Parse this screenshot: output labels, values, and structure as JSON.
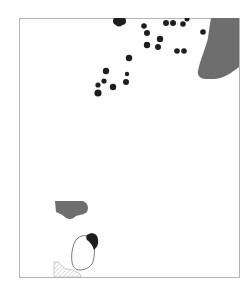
{
  "map": {
    "frame": {
      "x": 19,
      "y": 18,
      "width": 220,
      "height": 259,
      "stroke": "#b4b4b4"
    },
    "colors": {
      "dot": "#1e1e1e",
      "region_fill": "#6e6e6e",
      "outline": "#555555",
      "hatch": "#bdbdbd",
      "background": "#ffffff"
    },
    "dots": [
      {
        "cx": 117,
        "cy": 21,
        "r": 4
      },
      {
        "cx": 122,
        "cy": 21,
        "r": 4
      },
      {
        "cx": 119,
        "cy": 23,
        "r": 3.5
      },
      {
        "cx": 144,
        "cy": 26,
        "r": 2.8
      },
      {
        "cx": 166,
        "cy": 23,
        "r": 3
      },
      {
        "cx": 173,
        "cy": 23,
        "r": 3
      },
      {
        "cx": 183,
        "cy": 24,
        "r": 2.8
      },
      {
        "cx": 187,
        "cy": 19,
        "r": 2.5
      },
      {
        "cx": 147,
        "cy": 33,
        "r": 3
      },
      {
        "cx": 160,
        "cy": 39,
        "r": 3.2
      },
      {
        "cx": 147,
        "cy": 45,
        "r": 3.2
      },
      {
        "cx": 158,
        "cy": 47,
        "r": 3
      },
      {
        "cx": 203,
        "cy": 32,
        "r": 2.8
      },
      {
        "cx": 177,
        "cy": 51,
        "r": 2.8
      },
      {
        "cx": 184,
        "cy": 51,
        "r": 2.8
      },
      {
        "cx": 129,
        "cy": 58,
        "r": 3.2
      },
      {
        "cx": 106,
        "cy": 71,
        "r": 3.2
      },
      {
        "cx": 127,
        "cy": 74,
        "r": 2.2
      },
      {
        "cx": 104,
        "cy": 81,
        "r": 2.6
      },
      {
        "cx": 126,
        "cy": 82,
        "r": 3
      },
      {
        "cx": 98,
        "cy": 85,
        "r": 2.6
      },
      {
        "cx": 113,
        "cy": 87,
        "r": 3.2
      },
      {
        "cx": 98,
        "cy": 93,
        "r": 3.6
      }
    ],
    "regions": [
      {
        "name": "east-region",
        "type": "filled",
        "path": "M211,18 L239,18 L239,67 C232,72 226,78 214,79 L206,79 C199,79 197,74 198,71 C200,60 205,50 208,38 C209,30 210,24 211,18 Z"
      },
      {
        "name": "southwest-region",
        "type": "filled",
        "path": "M55,201 L83,201 C88,203 89,208 87,212 C85,214 80,215 76,216 C73,219 70,220 66,218 C62,214 58,213 56,212 Z"
      },
      {
        "name": "outlined-area",
        "type": "outline",
        "path": "M82,236 C88,234 94,240 94,246 C95,253 94,260 92,264 C89,268 84,270 80,270 C75,270 73,267 72,262 C71,256 72,249 74,244 C75,240 78,237 82,236 Z"
      },
      {
        "name": "dark-cap",
        "type": "filled-dark",
        "path": "M87,235 C92,231 98,234 98,240 C99,245 96,248 94,250 C93,246 90,242 87,240 C86,239 86,236 87,235 Z"
      },
      {
        "name": "hatched-area",
        "type": "hatched",
        "path": "M54,262 L58,262 C61,264 63,268 66,269 C71,269 76,271 80,274 L81,277 L54,277 Z"
      }
    ]
  }
}
